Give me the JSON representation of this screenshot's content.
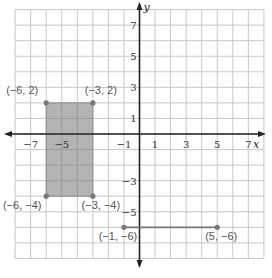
{
  "graph": {
    "axes": {
      "x_label": "x",
      "y_label": "y",
      "range": [
        -8,
        8
      ]
    },
    "x_ticks": [
      {
        "value": -7,
        "label": "−7"
      },
      {
        "value": -5,
        "label": "−5"
      },
      {
        "value": -1,
        "label": "−1"
      },
      {
        "value": 1,
        "label": "1"
      },
      {
        "value": 3,
        "label": "3"
      },
      {
        "value": 5,
        "label": "5"
      },
      {
        "value": 7,
        "label": "7"
      }
    ],
    "y_ticks": [
      {
        "value": 7,
        "label": "7"
      },
      {
        "value": 5,
        "label": "5"
      },
      {
        "value": 3,
        "label": "3"
      },
      {
        "value": 1,
        "label": "1"
      },
      {
        "value": -3,
        "label": "−3"
      },
      {
        "value": -5,
        "label": "−5"
      }
    ],
    "rectangle": {
      "fill": "#b3b3b3",
      "stroke": "#888888",
      "vertices": [
        {
          "label": "(−6, 2)",
          "x": -6,
          "y": 2
        },
        {
          "label": "(−3, 2)",
          "x": -3,
          "y": 2
        },
        {
          "label": "(−3, −4)",
          "x": -3,
          "y": -4
        },
        {
          "label": "(−6, −4)",
          "x": -6,
          "y": -4
        }
      ]
    },
    "segment": {
      "stroke": "#777777",
      "endpoints": [
        {
          "label": "(−1, −6)",
          "x": -1,
          "y": -6
        },
        {
          "label": "(5, −6)",
          "x": 5,
          "y": -6
        }
      ]
    }
  }
}
